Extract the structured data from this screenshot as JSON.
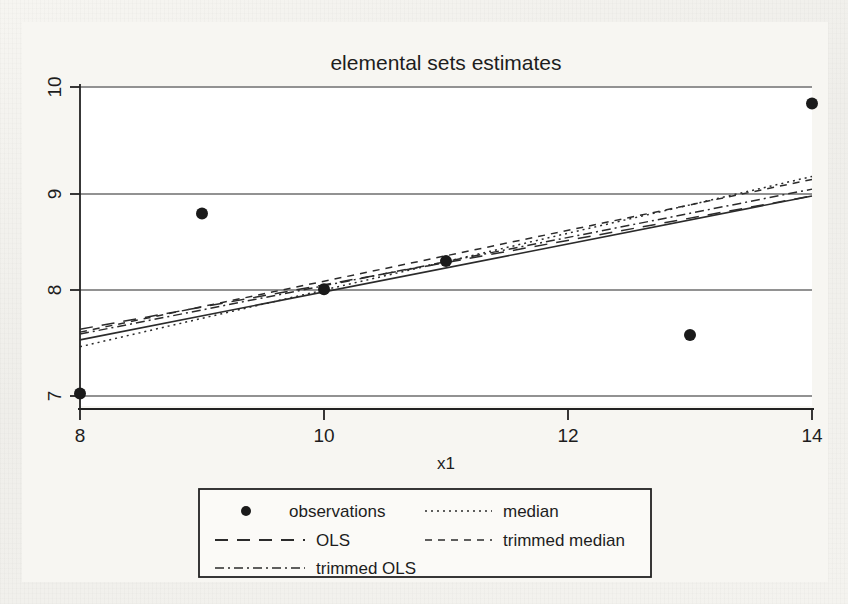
{
  "figure": {
    "title": "elemental sets estimates",
    "background_color": "#f3f2ee",
    "plot_background_color": "#ffffff",
    "ink_color": "#222222",
    "gridline_color": "#6b6b6b"
  },
  "axes": {
    "x": {
      "label": "x1",
      "ticks": [
        "8",
        "10",
        "12",
        "14"
      ],
      "tick_values": [
        8,
        10,
        12,
        14
      ],
      "range": [
        8,
        14
      ]
    },
    "y": {
      "label": "",
      "ticks": [
        "7",
        "8",
        "9",
        "10"
      ],
      "tick_values": [
        7,
        8,
        9,
        10
      ],
      "range": [
        6.82,
        10.12
      ],
      "label_orientation": "rotated"
    }
  },
  "legend": {
    "entries": [
      {
        "label": "observations",
        "style": "marker",
        "column": 0,
        "row": 0
      },
      {
        "label": "median",
        "style": "dotted",
        "column": 1,
        "row": 0
      },
      {
        "label": "OLS",
        "style": "dashed-long",
        "column": 0,
        "row": 1
      },
      {
        "label": "trimmed median",
        "style": "dashed-short",
        "column": 1,
        "row": 1
      },
      {
        "label": "trimmed OLS",
        "style": "dash-dot",
        "column": 0,
        "row": 2
      }
    ]
  },
  "chart_data": {
    "type": "scatter",
    "title": "elemental sets estimates",
    "xlabel": "x1",
    "ylabel": "",
    "xlim": [
      8,
      14
    ],
    "ylim": [
      6.82,
      10.12
    ],
    "grid": true,
    "grid_axis": "y",
    "legend_position": "bottom",
    "series": [
      {
        "name": "observations",
        "type": "scatter",
        "marker": "filled-circle",
        "x": [
          8,
          9,
          10,
          11,
          13,
          14
        ],
        "y": [
          6.97,
          8.82,
          8.04,
          8.33,
          7.57,
          9.95
        ]
      },
      {
        "name": "median",
        "type": "line",
        "style": "dotted",
        "x": [
          8,
          14
        ],
        "y": [
          7.45,
          9.2
        ],
        "slope": 0.2917,
        "intercept": 5.1167
      },
      {
        "name": "OLS",
        "type": "line",
        "style": "dashed-long",
        "x": [
          8,
          14
        ],
        "y": [
          7.63,
          9.0
        ],
        "slope": 0.2283,
        "intercept": 5.8033
      },
      {
        "name": "trimmed median",
        "type": "line",
        "style": "dashed-short",
        "x": [
          8,
          14
        ],
        "y": [
          7.6,
          9.17
        ],
        "slope": 0.2617,
        "intercept": 5.5067
      },
      {
        "name": "trimmed OLS",
        "type": "line",
        "style": "dash-dot",
        "x": [
          8,
          14
        ],
        "y": [
          7.58,
          9.07
        ],
        "slope": 0.2483,
        "intercept": 5.5933
      },
      {
        "name": "fit-solid",
        "type": "line",
        "style": "solid",
        "x": [
          8,
          14
        ],
        "y": [
          7.52,
          9.0
        ],
        "slope": 0.2467,
        "intercept": 5.5467
      }
    ]
  }
}
